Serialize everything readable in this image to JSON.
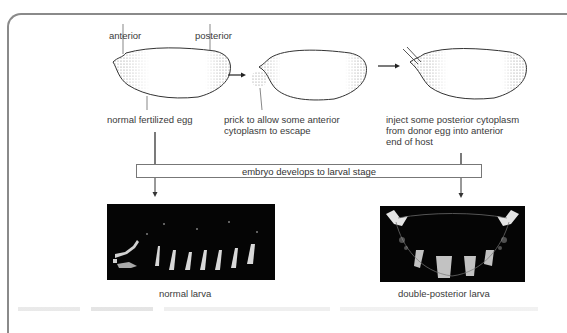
{
  "diagram": {
    "labels": {
      "anterior": "anterior",
      "posterior": "posterior",
      "egg1_caption": "normal fertilized egg",
      "egg2_caption_line1": "prick to allow some anterior",
      "egg2_caption_line2": "cytoplasm to escape",
      "egg3_caption_line1": "inject some posterior cytoplasm",
      "egg3_caption_line2": "from donor egg into anterior",
      "egg3_caption_line3": "end of host"
    },
    "stage_box": "embryo develops to larval stage",
    "larvae": [
      {
        "label": "normal larva",
        "segments": 8
      },
      {
        "label": "double-posterior larva",
        "segments": 4
      }
    ],
    "colors": {
      "frame": "#8a8a8a",
      "outline": "#333333",
      "stipple": "#9a9a9a",
      "larva_bg": "#050505"
    }
  }
}
